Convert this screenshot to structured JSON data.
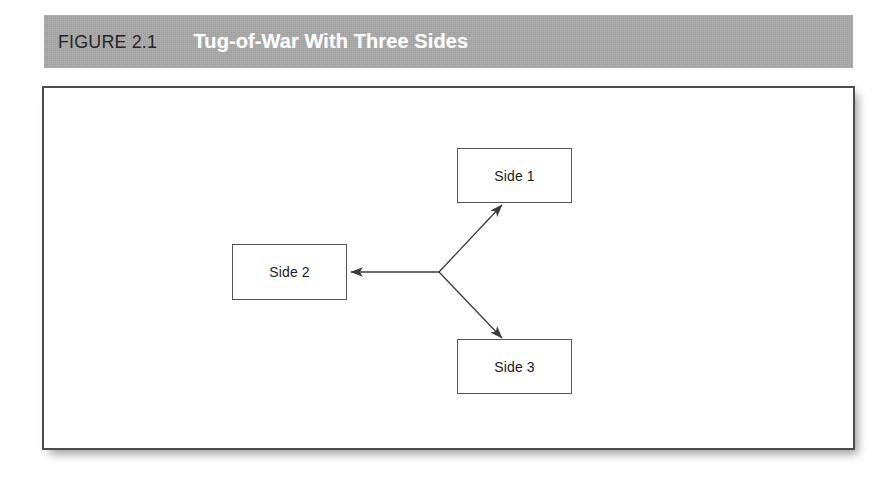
{
  "figure": {
    "label": "FIGURE 2.1",
    "title": "Tug-of-War With Three Sides"
  },
  "colors": {
    "header_band": "#a9a9a9",
    "header_label_text": "#262626",
    "header_title_text": "#ffffff",
    "panel_border": "#4c4c4c",
    "node_border": "#555555",
    "node_fill": "#ffffff",
    "arrow_stroke": "#3a3a3a",
    "page_background": "#ffffff"
  },
  "diagram": {
    "type": "node-arrow-diagram",
    "hub": {
      "x": 395,
      "y": 184
    },
    "nodes": [
      {
        "id": "side-1",
        "label": "Side 1",
        "x": 413,
        "y": 60,
        "width": 115,
        "height": 55
      },
      {
        "id": "side-2",
        "label": "Side 2",
        "x": 188,
        "y": 156,
        "width": 115,
        "height": 56
      },
      {
        "id": "side-3",
        "label": "Side 3",
        "x": 413,
        "y": 251,
        "width": 115,
        "height": 55
      }
    ],
    "arrows": [
      {
        "id": "arrow-to-side-1",
        "from": "hub",
        "to": "side-1",
        "x1": 395,
        "y1": 184,
        "x2": 458,
        "y2": 116,
        "direction": "up-right"
      },
      {
        "id": "arrow-to-side-2",
        "from": "hub",
        "to": "side-2",
        "x1": 395,
        "y1": 184,
        "x2": 306,
        "y2": 184,
        "direction": "left"
      },
      {
        "id": "arrow-to-side-3",
        "from": "hub",
        "to": "side-3",
        "x1": 395,
        "y1": 184,
        "x2": 458,
        "y2": 250,
        "direction": "down-right"
      }
    ]
  }
}
